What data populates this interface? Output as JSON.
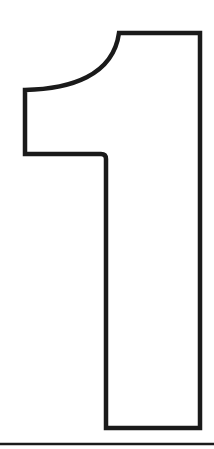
{
  "figure": {
    "glyph": "1",
    "style": "outlined numeral",
    "stroke_color": "#1a1a1a",
    "fill_color": "#ffffff",
    "background": "#ffffff",
    "has_baseline_rule": true
  }
}
